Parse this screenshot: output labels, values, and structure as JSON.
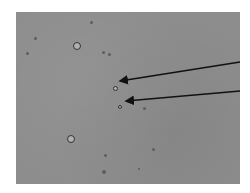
{
  "image": {
    "description": "Grayscale brightfield microscopy field with scattered small round particles/cells; two black arrows point from the right edge toward two small cells near the center.",
    "background_color": "#8d8d8d",
    "arrow_color": "#111111"
  },
  "cells": [
    {
      "x": 77,
      "y": 46,
      "r": 4,
      "ring": true
    },
    {
      "x": 71,
      "y": 139,
      "r": 4,
      "ring": true
    },
    {
      "x": 115,
      "y": 88,
      "r": 2.5,
      "ring": true
    },
    {
      "x": 120,
      "y": 107,
      "r": 2,
      "ring": true
    },
    {
      "x": 35,
      "y": 38,
      "r": 1.5,
      "ring": false
    },
    {
      "x": 27,
      "y": 53,
      "r": 1.5,
      "ring": false
    },
    {
      "x": 91,
      "y": 22,
      "r": 1.5,
      "ring": false
    },
    {
      "x": 103,
      "y": 52,
      "r": 1.5,
      "ring": false
    },
    {
      "x": 109,
      "y": 54,
      "r": 1.5,
      "ring": false
    },
    {
      "x": 144,
      "y": 108,
      "r": 1.5,
      "ring": false
    },
    {
      "x": 153,
      "y": 149,
      "r": 1.5,
      "ring": false
    },
    {
      "x": 105,
      "y": 155,
      "r": 1.5,
      "ring": false
    },
    {
      "x": 104,
      "y": 172,
      "r": 2,
      "ring": false
    },
    {
      "x": 139,
      "y": 169,
      "r": 1.2,
      "ring": false
    }
  ],
  "arrows": [
    {
      "x1": 240,
      "y1": 62,
      "x2": 120,
      "y2": 81
    },
    {
      "x1": 240,
      "y1": 91,
      "x2": 126,
      "y2": 101
    }
  ]
}
